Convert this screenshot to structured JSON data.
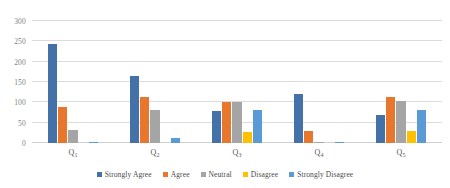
{
  "chart_data": {
    "type": "bar",
    "title": "",
    "subtitle": "",
    "xlabel": "",
    "ylabel": "",
    "categories": [
      "Q1",
      "Q2",
      "Q3",
      "Q4",
      "Q5"
    ],
    "category_labels": [
      "Q",
      "Q",
      "Q",
      "Q",
      "Q"
    ],
    "category_subscripts": [
      "1",
      "2",
      "3",
      "4",
      "5"
    ],
    "ylim": [
      0,
      300
    ],
    "yticks": [
      0,
      50,
      100,
      150,
      200,
      250,
      300
    ],
    "ytick_labels": [
      "0",
      "50",
      "100",
      "150",
      "200",
      "250",
      "300"
    ],
    "grid": "horizontal",
    "legend_position": "bottom",
    "series": [
      {
        "name": "Strongly Agree",
        "color": "#4472A8",
        "values": [
          243,
          165,
          78,
          120,
          70
        ]
      },
      {
        "name": "Agree",
        "color": "#E8762C",
        "values": [
          88,
          112,
          100,
          30,
          112
        ]
      },
      {
        "name": "Neutral",
        "color": "#A5A5A5",
        "values": [
          33,
          80,
          100,
          2,
          103
        ]
      },
      {
        "name": "Disagree",
        "color": "#FFC000",
        "values": [
          0,
          0,
          28,
          0,
          30
        ]
      },
      {
        "name": "Strongly Disagree",
        "color": "#5B9BD5",
        "values": [
          2,
          13,
          80,
          2,
          82
        ]
      }
    ]
  },
  "colors": {
    "background": "#FFFFFF",
    "gridline": "#DCDCDC",
    "axis_text": "#7F7F7F",
    "category_text": "#595959",
    "legend_text": "#4A4A4A"
  }
}
